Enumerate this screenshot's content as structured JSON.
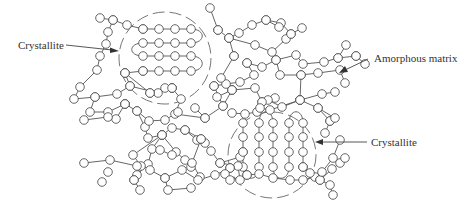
{
  "figure": {
    "labels": {
      "crystallite_top": "Crystallite",
      "amorphous": "Amorphous matrix",
      "crystallite_bottom": "Crystallite"
    },
    "colors": {
      "line": "#555555",
      "node_fill": "#ffffff",
      "text": "#333333"
    }
  }
}
